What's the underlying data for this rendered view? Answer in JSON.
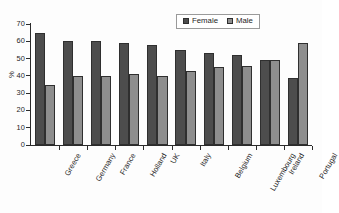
{
  "chart_data": {
    "type": "bar",
    "title": "",
    "xlabel": "",
    "ylabel": "%",
    "ylim": [
      0,
      70
    ],
    "yticks": [
      0,
      10,
      20,
      30,
      40,
      50,
      60,
      70
    ],
    "grid": false,
    "legend_position": "top-right",
    "categories": [
      "Greece",
      "Germany",
      "France",
      "Holland",
      "UK",
      "Italy",
      "Belgium",
      "Luxembourg",
      "Ireland",
      "Portugal"
    ],
    "series": [
      {
        "name": "Female",
        "color": "#4d4d4d",
        "values": [
          65,
          60,
          60,
          59,
          58,
          55,
          53,
          52,
          49,
          39
        ]
      },
      {
        "name": "Male",
        "color": "#8e8e8e",
        "values": [
          35,
          40,
          40,
          41,
          40,
          43,
          45,
          46,
          49,
          59
        ]
      }
    ]
  },
  "legend": {
    "items": [
      {
        "label": "Female"
      },
      {
        "label": "Male"
      }
    ]
  },
  "axes": {
    "y_title": "%",
    "y_tick_labels": [
      "70",
      "60",
      "50",
      "40",
      "30",
      "20",
      "10",
      "0"
    ]
  }
}
